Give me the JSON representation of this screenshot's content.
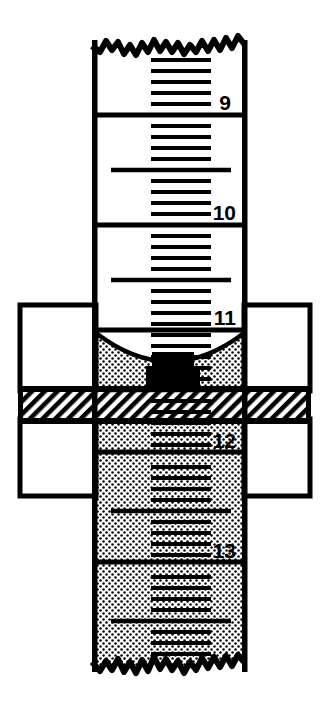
{
  "figure": {
    "name": "burette-meniscus-reading-card",
    "background_color": "#ffffff",
    "ink_color": "#000000"
  },
  "tube": {
    "name": "burette-tube",
    "left": 93,
    "right": 247,
    "torn_top_y": 40,
    "torn_bottom_y": 672,
    "wall_thickness": 5,
    "scale_direction": "increasing-downward",
    "scale_labels": [
      {
        "value": "9",
        "y": 103,
        "x": 231
      },
      {
        "value": "10",
        "y": 213,
        "x": 224
      },
      {
        "value": "11",
        "y": 318,
        "x": 224
      },
      {
        "value": "12",
        "y": 441,
        "x": 224
      },
      {
        "value": "13",
        "y": 551,
        "x": 224
      }
    ],
    "major_division_y": [
      115,
      225,
      330,
      452,
      562
    ],
    "minor_tick_spacing": 11.0,
    "half_unit_tick_y": [
      170,
      279,
      395,
      506,
      617
    ]
  },
  "liquid": {
    "name": "stippled-liquid",
    "fill_pattern": "stipple-dots",
    "meniscus_bottom_y": 356,
    "meniscus_rim_y": 335,
    "meniscus_shape": "concave-arc"
  },
  "card": {
    "name": "reading-card",
    "left": 20,
    "right": 310,
    "top": 305,
    "bottom": 496,
    "fill": "#ffffff",
    "border_thickness": 5,
    "band": {
      "name": "hatched-black-band",
      "top": 389,
      "bottom": 421,
      "fill_pattern": "diagonal-hatch",
      "edge_thickness": 5
    }
  },
  "marks": {
    "dark_meniscus_block_y": 356,
    "dark_meniscus_block_height": 14
  },
  "labels": {
    "nine": "9",
    "ten": "10",
    "eleven": "11",
    "twelve": "12",
    "thirteen": "13"
  }
}
